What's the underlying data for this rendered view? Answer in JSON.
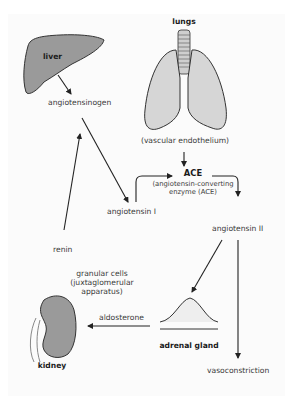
{
  "diagram": {
    "organs": {
      "liver": "liver",
      "lungs": "lungs",
      "kidney": "kidney",
      "adrenal_gland": "adrenal gland"
    },
    "nodes": {
      "angiotensinogen": "angiotensinogen",
      "vascular_endothelium": "(vascular endothelium)",
      "ace_title": "ACE",
      "ace_line1": "(angiotensin-converting",
      "ace_line2": "enzyme (ACE)",
      "angiotensin_1": "angiotensin I",
      "angiotensin_2": "angiotensin II",
      "renin": "renin",
      "granular_line1": "granular cells",
      "granular_line2": "(juxtaglomerular",
      "granular_line3": "apparatus)",
      "aldosterone": "aldosterone",
      "vasoconstriction": "vasoconstriction"
    },
    "edges": [
      {
        "from": "liver",
        "to": "angiotensinogen"
      },
      {
        "from": "angiotensinogen",
        "to": "angiotensin I"
      },
      {
        "from": "renin",
        "to": "angiotensinogen"
      },
      {
        "from": "angiotensin I",
        "to": "ACE"
      },
      {
        "from": "vascular endothelium",
        "to": "ACE"
      },
      {
        "from": "ACE",
        "to": "angiotensin II"
      },
      {
        "from": "angiotensin II",
        "to": "adrenal gland"
      },
      {
        "from": "angiotensin II",
        "to": "vasoconstriction"
      },
      {
        "from": "adrenal gland",
        "to": "kidney",
        "label": "aldosterone"
      }
    ],
    "colors": {
      "organ_fill": "#9a9a9a",
      "lung_fill": "#d6d6d6",
      "outline": "#333333",
      "arrow": "#222222",
      "text": "#3a3a3a"
    }
  }
}
